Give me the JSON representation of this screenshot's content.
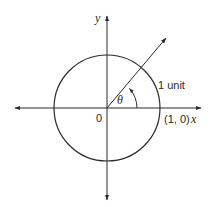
{
  "diagram": {
    "labels": {
      "y_axis": "y",
      "x_axis": "x",
      "origin": "0",
      "theta": "θ",
      "radius": "1 unit",
      "point": "(1, 0)"
    },
    "geometry": {
      "origin": [
        107,
        108
      ],
      "radius": 53,
      "ray_angle_deg": 45
    },
    "colors": {
      "stroke": "#2a2a2a",
      "background": "#ffffff"
    }
  }
}
